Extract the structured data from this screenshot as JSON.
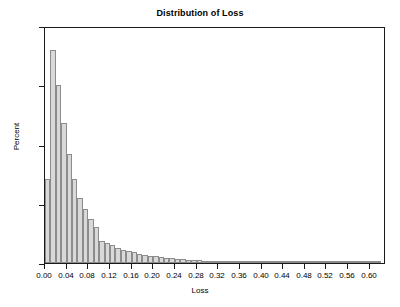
{
  "chart_data": {
    "type": "bar",
    "title": "Distribution of Loss",
    "xlabel": "Loss",
    "ylabel": "Percent",
    "xlim": [
      0.0,
      0.63
    ],
    "ylim": [
      0,
      20
    ],
    "grid": false,
    "legend": null,
    "bin_width": 0.01,
    "orientation": "vertical",
    "bar_fill_color": "#d9d9d9",
    "bar_edge_color": "#8c8c8c",
    "frame_color": "#1a1a1a",
    "background_color": "#ffffff",
    "xticks": [
      0.0,
      0.04,
      0.08,
      0.12,
      0.16,
      0.2,
      0.24,
      0.28,
      0.32,
      0.36,
      0.4,
      0.44,
      0.48,
      0.52,
      0.56,
      0.6
    ],
    "xtick_labels": [
      "0.00",
      "0.04",
      "0.08",
      "0.12",
      "0.16",
      "0.20",
      "0.24",
      "0.28",
      "0.32",
      "0.36",
      "0.40",
      "0.44",
      "0.48",
      "0.52",
      "0.56",
      "0.60"
    ],
    "yticks": [
      0,
      5,
      10,
      15,
      20
    ],
    "ytick_labels": [
      "0",
      "5",
      "10",
      "15",
      "20"
    ],
    "categories": [
      "0.000",
      "0.010",
      "0.020",
      "0.030",
      "0.040",
      "0.050",
      "0.060",
      "0.070",
      "0.080",
      "0.090",
      "0.100",
      "0.110",
      "0.120",
      "0.130",
      "0.140",
      "0.150",
      "0.160",
      "0.170",
      "0.180",
      "0.190",
      "0.200",
      "0.210",
      "0.220",
      "0.230",
      "0.240",
      "0.250",
      "0.260",
      "0.270",
      "0.280",
      "0.290",
      "0.300",
      "0.310",
      "0.320",
      "0.330",
      "0.340",
      "0.350",
      "0.360",
      "0.370",
      "0.380",
      "0.390",
      "0.400",
      "0.410",
      "0.420",
      "0.430",
      "0.440",
      "0.450",
      "0.460",
      "0.470",
      "0.480",
      "0.490",
      "0.500",
      "0.510",
      "0.520",
      "0.530",
      "0.540",
      "0.550",
      "0.560",
      "0.570",
      "0.580",
      "0.590",
      "0.600",
      "0.610"
    ],
    "values": [
      7.1,
      18.0,
      15.0,
      11.8,
      9.2,
      7.1,
      5.5,
      4.6,
      3.7,
      3.0,
      1.9,
      1.7,
      1.5,
      1.3,
      1.1,
      1.0,
      0.9,
      0.8,
      0.7,
      0.6,
      0.55,
      0.5,
      0.45,
      0.4,
      0.36,
      0.32,
      0.29,
      0.26,
      0.23,
      0.21,
      0.19,
      0.17,
      0.15,
      0.13,
      0.12,
      0.1,
      0.09,
      0.08,
      0.07,
      0.06,
      0.05,
      0.05,
      0.04,
      0.04,
      0.03,
      0.03,
      0.03,
      0.02,
      0.02,
      0.02,
      0.02,
      0.01,
      0.01,
      0.01,
      0.01,
      0.01,
      0.01,
      0.01,
      0.01,
      0.01,
      0.01,
      0.01
    ]
  }
}
